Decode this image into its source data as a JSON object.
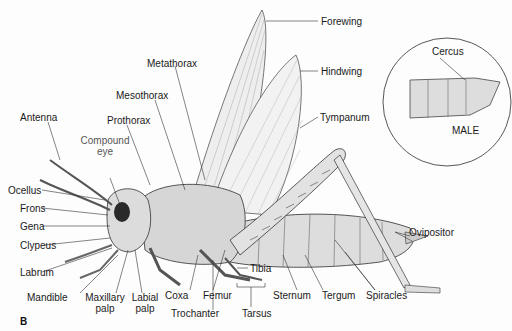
{
  "figure": {
    "panel_letter": "B",
    "inset_caption": "MALE"
  },
  "labels": {
    "forewing": "Forewing",
    "hindwing": "Hindwing",
    "metathorax": "Metathorax",
    "mesothorax": "Mesothorax",
    "prothorax": "Prothorax",
    "tympanum": "Tympanum",
    "antenna": "Antenna",
    "compound_eye_1": "Compound",
    "compound_eye_2": "eye",
    "ocellus": "Ocellus",
    "frons": "Frons",
    "gena": "Gena",
    "clypeus": "Clypeus",
    "labrum": "Labrum",
    "mandible": "Mandible",
    "maxillary_palp_1": "Maxillary",
    "maxillary_palp_2": "palp",
    "labial_palp_1": "Labial",
    "labial_palp_2": "palp",
    "coxa": "Coxa",
    "trochanter": "Trochanter",
    "femur": "Femur",
    "tibia": "Tibia",
    "tarsus": "Tarsus",
    "sternum": "Sternum",
    "tergum": "Tergum",
    "spiracles": "Spiracles",
    "ovipositor": "Ovipositor",
    "cercus": "Cercus"
  },
  "colors": {
    "line": "#333333",
    "body_fill": "#d9d9d9",
    "wing_fill": "#efefef",
    "eye": "#2a2a2a"
  }
}
